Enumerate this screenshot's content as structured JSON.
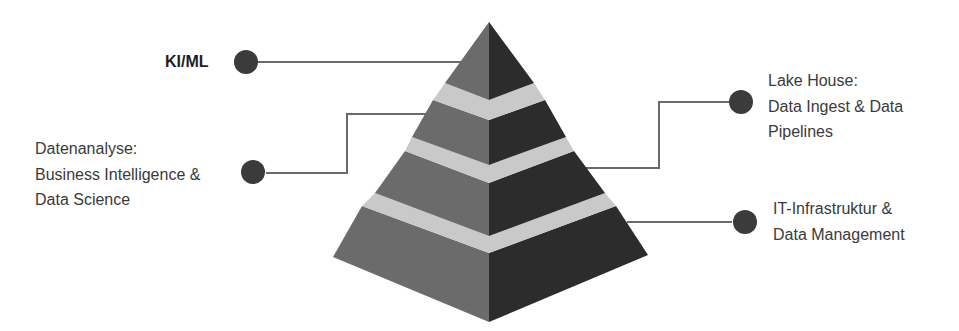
{
  "diagram": {
    "type": "pyramid",
    "colors": {
      "left_face": "#6b6b6b",
      "right_face": "#2c2c2c",
      "separator_band": "#c9c9c9",
      "connector_line": "#6a6a6a",
      "dot": "#3b3b3b",
      "text": "#3a3a3a"
    },
    "tiers": [
      {
        "level": 1,
        "position": "top",
        "label_lines": [
          "KI/ML"
        ],
        "side": "left",
        "bold": true
      },
      {
        "level": 2,
        "position": "second",
        "label_lines": [
          "Lake House:",
          "Data Ingest & Data",
          "Pipelines"
        ],
        "side": "right",
        "bold": false
      },
      {
        "level": 3,
        "position": "third",
        "label_lines": [
          "Datenanalyse:",
          "Business Intelligence &",
          "Data Science"
        ],
        "side": "left",
        "bold": false
      },
      {
        "level": 4,
        "position": "base",
        "label_lines": [
          "IT-Infrastruktur &",
          "Data Management"
        ],
        "side": "right",
        "bold": false
      }
    ]
  }
}
